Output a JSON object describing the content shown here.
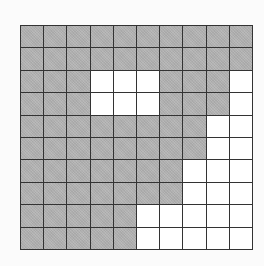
{
  "grid": {
    "rows": 10,
    "cols": 10,
    "filled_color": "#b3b3b3",
    "empty_color": "#ffffff",
    "line_color": "#333333",
    "cells": [
      [
        1,
        1,
        1,
        1,
        1,
        1,
        1,
        1,
        1,
        1
      ],
      [
        1,
        1,
        1,
        1,
        1,
        1,
        1,
        1,
        1,
        1
      ],
      [
        1,
        1,
        1,
        0,
        0,
        0,
        1,
        1,
        1,
        0
      ],
      [
        1,
        1,
        1,
        0,
        0,
        0,
        1,
        1,
        1,
        0
      ],
      [
        1,
        1,
        1,
        1,
        1,
        1,
        1,
        1,
        0,
        0
      ],
      [
        1,
        1,
        1,
        1,
        1,
        1,
        1,
        1,
        0,
        0
      ],
      [
        1,
        1,
        1,
        1,
        1,
        1,
        1,
        0,
        0,
        0
      ],
      [
        1,
        1,
        1,
        1,
        1,
        1,
        1,
        0,
        0,
        0
      ],
      [
        1,
        1,
        1,
        1,
        1,
        0,
        0,
        0,
        0,
        0
      ],
      [
        1,
        1,
        1,
        1,
        1,
        0,
        0,
        0,
        0,
        0
      ]
    ]
  }
}
